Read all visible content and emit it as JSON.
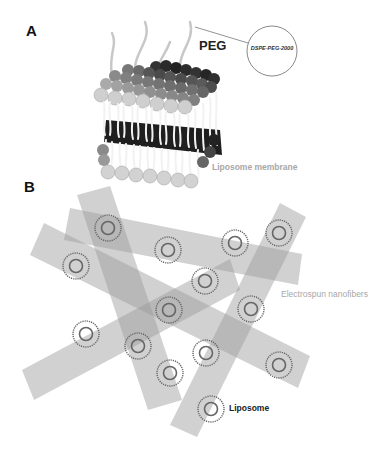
{
  "panels": {
    "a": {
      "label": "A",
      "peg_label": "PEG",
      "inset_label": "DSPE-PEG-2000",
      "membrane_label": "Liposome membrane"
    },
    "b": {
      "label": "B",
      "fiber_label": "Electrospun nanofibers",
      "liposome_label": "Liposome"
    }
  },
  "colors": {
    "fiber": "#9a9a9a",
    "liposome_ring": "#666666",
    "membrane_label": "#a8a8a8",
    "head_light": "#cfcfcf",
    "head_mid": "#9a9a9a",
    "head_dark": "#222222"
  }
}
